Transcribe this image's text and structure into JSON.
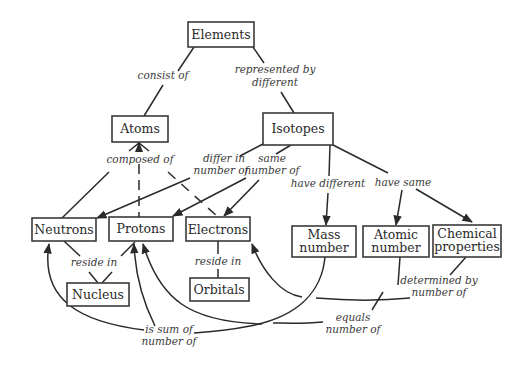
{
  "diagram": {
    "type": "concept-map",
    "nodes": {
      "elements": "Elements",
      "atoms": "Atoms",
      "isotopes": "Isotopes",
      "neutrons": "Neutrons",
      "protons": "Protons",
      "electrons": "Electrons",
      "nucleus": "Nucleus",
      "orbitals": "Orbitals",
      "mass_number": [
        "Mass",
        "number"
      ],
      "atomic_number": [
        "Atomic",
        "number"
      ],
      "chemical_properties": [
        "Chemical",
        "properties"
      ]
    },
    "links": {
      "consist_of": "consist of",
      "represented_by_different": [
        "represented by",
        "different"
      ],
      "composed_of": "composed of",
      "differ_in_number_of": [
        "differ in",
        "number of"
      ],
      "same_number_of": [
        "same",
        "number of"
      ],
      "have_different": "have different",
      "have_same": "have same",
      "reside_in_nucleus": "reside in",
      "reside_in_orbitals": "reside in",
      "determined_by_number_of": [
        "determined by",
        "number of"
      ],
      "equals_number_of": [
        "equals",
        "number of"
      ],
      "is_sum_of_number_of": [
        "is sum of",
        "number of"
      ]
    },
    "edges": [
      {
        "from": "Elements",
        "to": "Atoms",
        "label": "consist of"
      },
      {
        "from": "Elements",
        "to": "Isotopes",
        "label": "represented by different"
      },
      {
        "from": "Atoms",
        "to": [
          "Neutrons",
          "Protons",
          "Electrons"
        ],
        "label": "composed of"
      },
      {
        "from": "Isotopes",
        "to": "Neutrons",
        "label": "differ in number of"
      },
      {
        "from": "Isotopes",
        "to": [
          "Protons",
          "Electrons"
        ],
        "label": "same number of"
      },
      {
        "from": "Isotopes",
        "to": "Mass number",
        "label": "have different"
      },
      {
        "from": "Isotopes",
        "to": [
          "Atomic number",
          "Chemical properties"
        ],
        "label": "have same"
      },
      {
        "from": [
          "Neutrons",
          "Protons"
        ],
        "to": "Nucleus",
        "label": "reside in"
      },
      {
        "from": "Electrons",
        "to": "Orbitals",
        "label": "reside in"
      },
      {
        "from": "Chemical properties",
        "to": "Electrons",
        "label": "determined by number of"
      },
      {
        "from": "Atomic number",
        "to": "Protons",
        "label": "equals number of"
      },
      {
        "from": "Mass number",
        "to": [
          "Neutrons",
          "Protons"
        ],
        "label": "is sum of number of"
      }
    ]
  }
}
